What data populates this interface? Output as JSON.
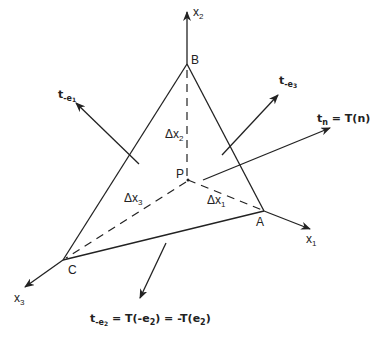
{
  "diagram": {
    "vertices": {
      "A": "A",
      "B": "B",
      "C": "C",
      "P": "P"
    },
    "axes": {
      "x1": "x",
      "x1_sub": "1",
      "x2": "x",
      "x2_sub": "2",
      "x3": "x",
      "x3_sub": "3"
    },
    "areas": {
      "dx1": "Δx",
      "dx1_sub": "1",
      "dx2": "Δx",
      "dx2_sub": "2",
      "dx3": "Δx",
      "dx3_sub": "3"
    },
    "vectors": {
      "t_e1": {
        "main": "t",
        "sub": "-e",
        "subsub": "1"
      },
      "t_e3": {
        "main": "t",
        "sub": "-e",
        "subsub": "3"
      },
      "t_n": {
        "main": "t",
        "sub": "n",
        "eq": " = T(",
        "arg": "n",
        "close": ")"
      },
      "t_e2": {
        "main": "t",
        "sub": "-e",
        "subsub": "2",
        "eq1": " = T(-",
        "e": "e",
        "esub": "2",
        "eq2": ") = -T(",
        "e2": "e",
        "e2sub": "2",
        "close": ")"
      }
    },
    "colors": {
      "stroke": "#222222",
      "background": "#ffffff"
    }
  }
}
